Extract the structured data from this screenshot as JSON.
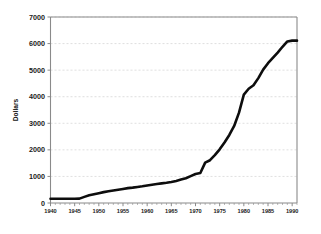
{
  "chart_data": {
    "type": "line",
    "title": "",
    "xlabel": "",
    "ylabel": "Dollars",
    "xlim": [
      1940,
      1991
    ],
    "ylim": [
      0,
      7000
    ],
    "grid": true,
    "legend": false,
    "x_tick_labels": [
      "1940",
      "1945",
      "1950",
      "1955",
      "1960",
      "1965",
      "1970",
      "1975",
      "1980",
      "1985",
      "1990"
    ],
    "x_tick_values": [
      1940,
      1945,
      1950,
      1955,
      1960,
      1965,
      1970,
      1975,
      1980,
      1985,
      1990
    ],
    "y_tick_labels": [
      "0",
      "1000",
      "2000",
      "3000",
      "4000",
      "5000",
      "6000",
      "7000"
    ],
    "y_tick_values": [
      0,
      1000,
      2000,
      3000,
      4000,
      5000,
      6000,
      7000
    ],
    "x_minor_tick_step": 1,
    "series": [
      {
        "name": "Dollars",
        "color": "#0d0d0d",
        "x": [
          1940,
          1941,
          1942,
          1943,
          1944,
          1945,
          1946,
          1947,
          1948,
          1949,
          1950,
          1951,
          1952,
          1953,
          1954,
          1955,
          1956,
          1957,
          1958,
          1959,
          1960,
          1961,
          1962,
          1963,
          1964,
          1965,
          1966,
          1967,
          1968,
          1969,
          1970,
          1971,
          1972,
          1973,
          1974,
          1975,
          1976,
          1977,
          1978,
          1979,
          1980,
          1981,
          1982,
          1983,
          1984,
          1985,
          1986,
          1987,
          1988,
          1989,
          1990,
          1991
        ],
        "values": [
          160,
          160,
          160,
          160,
          160,
          160,
          165,
          230,
          290,
          330,
          370,
          410,
          440,
          470,
          500,
          530,
          560,
          580,
          605,
          630,
          660,
          690,
          715,
          740,
          760,
          790,
          830,
          880,
          930,
          1010,
          1090,
          1130,
          1520,
          1610,
          1800,
          2020,
          2280,
          2560,
          2900,
          3400,
          4080,
          4300,
          4430,
          4700,
          5020,
          5260,
          5460,
          5660,
          5880,
          6080,
          6110,
          6110
        ]
      }
    ]
  },
  "axis": {
    "y_title": "Dollars"
  }
}
